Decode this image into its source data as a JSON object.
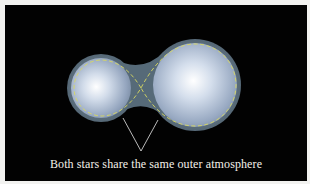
{
  "diagram": {
    "caption": "Both stars share the same outer atmosphere",
    "elements": [
      {
        "name": "smaller-star",
        "shape": "circle"
      },
      {
        "name": "larger-star",
        "shape": "circle"
      },
      {
        "name": "common-envelope",
        "description": "shared outer atmosphere enveloping both stars"
      },
      {
        "name": "roche-lobe-outline",
        "style": "yellow dashed figure-eight"
      },
      {
        "name": "pointer-lines",
        "count": 2
      }
    ],
    "colors": {
      "background": "#020202",
      "frame": "#f2f2f0",
      "star_highlight": "#ffffff",
      "star_body": "#aab8d0",
      "envelope": "#5d7180",
      "dashed_outline": "#d8d860",
      "caption_text": "#f4f1ea",
      "pointer_lines": "#e8e8e8"
    }
  }
}
